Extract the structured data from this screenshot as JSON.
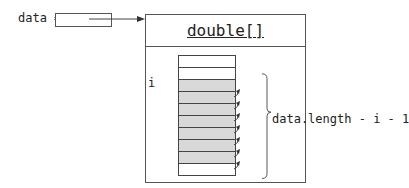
{
  "variable": {
    "label": "data =",
    "name": "data"
  },
  "object": {
    "type_label": "double[]",
    "cells": [
      {
        "index": 0,
        "shaded": false
      },
      {
        "index": 1,
        "shaded": false
      },
      {
        "index": 2,
        "shaded": true,
        "arrow": true
      },
      {
        "index": 3,
        "shaded": true,
        "arrow": true
      },
      {
        "index": 4,
        "shaded": true,
        "arrow": true
      },
      {
        "index": 5,
        "shaded": true,
        "arrow": true
      },
      {
        "index": 6,
        "shaded": true,
        "arrow": true
      },
      {
        "index": 7,
        "shaded": true,
        "arrow": true
      },
      {
        "index": 8,
        "shaded": true,
        "arrow": true
      },
      {
        "index": 9,
        "shaded": false
      }
    ]
  },
  "annotations": {
    "index_label": "i",
    "range_label": "data.length - i - 1"
  },
  "colors": {
    "line": "#555555",
    "shaded_cell": "#d9d9d9",
    "background": "#ffffff"
  }
}
